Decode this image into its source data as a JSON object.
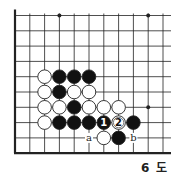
{
  "diagram": {
    "caption": "6 도",
    "grid": {
      "cols": 11,
      "rows": 10,
      "origin_x": 15,
      "origin_y": 15.5,
      "dx": 14.8,
      "dy": 15.3,
      "right_extent": 171
    },
    "edges": {
      "left": true,
      "bottom": true
    },
    "star_points": [
      {
        "c": 3,
        "r": 0
      },
      {
        "c": 9,
        "r": 0
      },
      {
        "c": 9,
        "r": 6
      }
    ],
    "stones": [
      {
        "c": 2,
        "r": 4,
        "color": "white"
      },
      {
        "c": 3,
        "r": 4,
        "color": "black"
      },
      {
        "c": 4,
        "r": 4,
        "color": "black"
      },
      {
        "c": 5,
        "r": 4,
        "color": "black"
      },
      {
        "c": 2,
        "r": 5,
        "color": "white"
      },
      {
        "c": 3,
        "r": 5,
        "color": "black"
      },
      {
        "c": 4,
        "r": 5,
        "color": "white"
      },
      {
        "c": 5,
        "r": 5,
        "color": "white"
      },
      {
        "c": 2,
        "r": 6,
        "color": "white"
      },
      {
        "c": 3,
        "r": 6,
        "color": "white"
      },
      {
        "c": 4,
        "r": 6,
        "color": "black"
      },
      {
        "c": 5,
        "r": 6,
        "color": "white"
      },
      {
        "c": 6,
        "r": 6,
        "color": "white"
      },
      {
        "c": 7,
        "r": 6,
        "color": "white"
      },
      {
        "c": 2,
        "r": 7,
        "color": "white"
      },
      {
        "c": 3,
        "r": 7,
        "color": "black"
      },
      {
        "c": 4,
        "r": 7,
        "color": "black"
      },
      {
        "c": 5,
        "r": 7,
        "color": "black"
      },
      {
        "c": 6,
        "r": 7,
        "color": "black",
        "label": "1"
      },
      {
        "c": 7,
        "r": 7,
        "color": "white",
        "label": "2"
      },
      {
        "c": 8,
        "r": 7,
        "color": "black"
      },
      {
        "c": 6,
        "r": 8,
        "color": "white"
      },
      {
        "c": 7,
        "r": 8,
        "color": "black"
      }
    ],
    "letters": [
      {
        "c": 5,
        "r": 8,
        "text": "a"
      },
      {
        "c": 8,
        "r": 8,
        "text": "b"
      }
    ],
    "colors": {
      "line": "#222222",
      "black_stone": "#111111",
      "white_stone": "#ffffff"
    }
  }
}
